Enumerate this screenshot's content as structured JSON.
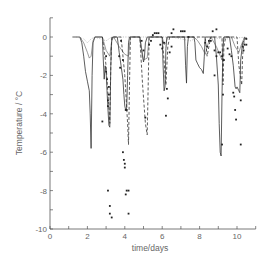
{
  "chart_data": {
    "type": "line",
    "title": "",
    "xlabel": "time/days",
    "ylabel": "Temperature / °C",
    "xlim": [
      0,
      11
    ],
    "ylim": [
      -10,
      1
    ],
    "xticks": [
      0,
      2,
      4,
      6,
      8,
      10
    ],
    "xminorticks": [
      1,
      3,
      5,
      7,
      9,
      11
    ],
    "yticks": [
      0,
      -2,
      -4,
      -6,
      -8,
      -10
    ],
    "yminorticks": [
      1,
      -1,
      -3,
      -5,
      -7,
      -9
    ],
    "grid": false,
    "legend": null,
    "series": [
      {
        "name": "solid line",
        "style": "solid",
        "points": [
          [
            1.2,
            0
          ],
          [
            1.6,
            0
          ],
          [
            1.7,
            -0.3
          ],
          [
            1.8,
            -1.0
          ],
          [
            1.9,
            -1.8
          ],
          [
            2.0,
            -2.3
          ],
          [
            2.1,
            -2.8
          ],
          [
            2.15,
            -4.0
          ],
          [
            2.2,
            -5.8
          ],
          [
            2.25,
            -2.0
          ],
          [
            2.3,
            -0.3
          ],
          [
            2.4,
            0
          ],
          [
            2.8,
            0
          ],
          [
            2.85,
            -1.2
          ],
          [
            2.9,
            -2.2
          ],
          [
            2.95,
            -1.5
          ],
          [
            3.0,
            -1.8
          ],
          [
            3.05,
            -2.8
          ],
          [
            3.1,
            -3.8
          ],
          [
            3.15,
            -4.6
          ],
          [
            3.2,
            -4.7
          ],
          [
            3.25,
            -1.5
          ],
          [
            3.3,
            -0.2
          ],
          [
            3.35,
            0
          ],
          [
            3.6,
            0
          ],
          [
            3.7,
            -0.8
          ],
          [
            3.8,
            -1.5
          ],
          [
            3.9,
            -2.2
          ],
          [
            3.95,
            -3.0
          ],
          [
            4.0,
            -3.6
          ],
          [
            4.05,
            -3.8
          ],
          [
            4.1,
            -3.7
          ],
          [
            4.15,
            -2.0
          ],
          [
            4.2,
            -0.3
          ],
          [
            4.25,
            0
          ],
          [
            4.8,
            0
          ],
          [
            4.9,
            -0.7
          ],
          [
            5.0,
            -1.3
          ],
          [
            5.05,
            -1.1
          ],
          [
            5.1,
            -0.3
          ],
          [
            5.2,
            0
          ],
          [
            6.0,
            0
          ],
          [
            6.05,
            -1.5
          ],
          [
            6.1,
            -2.8
          ],
          [
            6.15,
            -2.6
          ],
          [
            6.2,
            -0.6
          ],
          [
            6.25,
            0
          ],
          [
            7.2,
            0
          ],
          [
            7.25,
            -1.5
          ],
          [
            7.3,
            -2.4
          ],
          [
            7.35,
            -0.5
          ],
          [
            7.4,
            0
          ],
          [
            7.7,
            0
          ],
          [
            7.75,
            -0.3
          ],
          [
            7.8,
            -1.2
          ],
          [
            7.9,
            -1.4
          ],
          [
            8.0,
            -1.6
          ],
          [
            8.1,
            -1.7
          ],
          [
            8.2,
            -1.9
          ],
          [
            8.25,
            -1.0
          ],
          [
            8.3,
            0
          ],
          [
            8.8,
            0
          ],
          [
            8.9,
            -1.0
          ],
          [
            9.0,
            -2.5
          ],
          [
            9.05,
            -4.5
          ],
          [
            9.1,
            -6.0
          ],
          [
            9.15,
            -6.2
          ],
          [
            9.2,
            -3.0
          ],
          [
            9.25,
            -0.5
          ],
          [
            9.3,
            0
          ],
          [
            9.6,
            0
          ],
          [
            9.7,
            -0.7
          ],
          [
            9.8,
            -1.5
          ],
          [
            9.9,
            -2.6
          ],
          [
            9.95,
            -2.7
          ],
          [
            10.0,
            -2.6
          ],
          [
            10.1,
            -2.8
          ],
          [
            10.15,
            -2.9
          ],
          [
            10.2,
            -1.2
          ],
          [
            10.3,
            -0.3
          ],
          [
            10.5,
            0
          ]
        ]
      },
      {
        "name": "thin solid line",
        "style": "thin",
        "points": [
          [
            1.6,
            0
          ],
          [
            1.8,
            -0.3
          ],
          [
            2.0,
            -0.8
          ],
          [
            2.1,
            -1.1
          ],
          [
            2.2,
            -1.0
          ],
          [
            2.3,
            -0.2
          ],
          [
            2.4,
            0
          ],
          [
            2.8,
            0
          ],
          [
            3.0,
            -0.7
          ],
          [
            3.2,
            -1.0
          ],
          [
            3.3,
            -0.2
          ],
          [
            3.4,
            0
          ],
          [
            3.7,
            -0.5
          ],
          [
            4.0,
            -0.9
          ],
          [
            4.2,
            -1.0
          ],
          [
            4.3,
            0
          ],
          [
            4.8,
            0
          ],
          [
            5.0,
            -1.2
          ],
          [
            5.2,
            -1.1
          ],
          [
            5.3,
            0
          ],
          [
            6.0,
            0
          ],
          [
            6.1,
            -0.4
          ],
          [
            6.2,
            -0.3
          ],
          [
            6.3,
            0
          ],
          [
            7.7,
            0
          ],
          [
            7.9,
            -0.2
          ],
          [
            8.1,
            -0.5
          ],
          [
            8.3,
            -0.9
          ],
          [
            8.5,
            -0.2
          ],
          [
            8.6,
            0
          ],
          [
            8.9,
            -0.5
          ],
          [
            9.2,
            -1.2
          ],
          [
            9.3,
            0
          ],
          [
            9.7,
            0
          ],
          [
            9.9,
            -0.5
          ],
          [
            10.1,
            -0.8
          ],
          [
            10.2,
            -0.5
          ],
          [
            10.4,
            0
          ]
        ]
      },
      {
        "name": "dashed line",
        "style": "dashed",
        "points": [
          [
            2.8,
            0
          ],
          [
            3.0,
            -1.5
          ],
          [
            3.1,
            -3.0
          ],
          [
            3.2,
            -4.5
          ],
          [
            3.25,
            -1.5
          ],
          [
            3.3,
            0
          ],
          [
            3.8,
            0
          ],
          [
            4.0,
            -2.0
          ],
          [
            4.15,
            -4.5
          ],
          [
            4.2,
            -5.6
          ],
          [
            4.25,
            -2.5
          ],
          [
            4.3,
            0
          ],
          [
            4.8,
            0
          ],
          [
            4.95,
            -2.5
          ],
          [
            5.1,
            -4.5
          ],
          [
            5.2,
            -5.1
          ],
          [
            5.25,
            -2.5
          ],
          [
            5.3,
            0
          ],
          [
            6.0,
            0
          ],
          [
            6.2,
            -2.5
          ],
          [
            6.3,
            -0.5
          ],
          [
            6.4,
            0
          ],
          [
            8.3,
            0
          ],
          [
            8.4,
            -1.0
          ],
          [
            8.5,
            -0.5
          ],
          [
            8.6,
            0
          ],
          [
            9.2,
            0
          ],
          [
            9.25,
            -2.5
          ],
          [
            9.3,
            -0.5
          ],
          [
            9.4,
            0
          ],
          [
            10.0,
            0
          ],
          [
            10.1,
            -1.5
          ],
          [
            10.25,
            -2.5
          ],
          [
            10.3,
            -1.0
          ],
          [
            10.4,
            0
          ]
        ]
      },
      {
        "name": "dotted line",
        "style": "dotted",
        "points": [
          [
            1.4,
            0
          ],
          [
            1.8,
            -0.1
          ],
          [
            2.0,
            -0.3
          ],
          [
            2.2,
            -0.1
          ],
          [
            2.4,
            0
          ],
          [
            3.0,
            -0.2
          ],
          [
            3.3,
            0
          ],
          [
            6.5,
            0
          ],
          [
            7.0,
            -0.1
          ],
          [
            7.5,
            -0.2
          ],
          [
            8.0,
            0
          ],
          [
            9.5,
            -0.1
          ],
          [
            10.5,
            0
          ]
        ]
      },
      {
        "name": "observations",
        "style": "points",
        "points": [
          [
            2.8,
            -4.4
          ],
          [
            3.0,
            -1.0
          ],
          [
            3.0,
            -1.8
          ],
          [
            3.05,
            -2.2
          ],
          [
            3.1,
            -3.3
          ],
          [
            3.1,
            -3.6
          ],
          [
            3.15,
            -3.0
          ],
          [
            3.15,
            -2.6
          ],
          [
            3.1,
            -8.0
          ],
          [
            3.2,
            -8.8
          ],
          [
            3.2,
            -9.2
          ],
          [
            3.3,
            -9.4
          ],
          [
            3.7,
            -1.0
          ],
          [
            3.75,
            -1.6
          ],
          [
            3.8,
            -0.2
          ],
          [
            3.9,
            -1.2
          ],
          [
            3.9,
            -6.0
          ],
          [
            3.95,
            -6.4
          ],
          [
            4.0,
            -6.6
          ],
          [
            4.0,
            -6.8
          ],
          [
            4.05,
            -8.2
          ],
          [
            4.1,
            -8.0
          ],
          [
            4.2,
            -8.0
          ],
          [
            4.2,
            -9.2
          ],
          [
            4.05,
            -3.8
          ],
          [
            4.1,
            -3.8
          ],
          [
            4.9,
            -0.2
          ],
          [
            5.0,
            -0.7
          ],
          [
            5.1,
            -4.2
          ],
          [
            5.3,
            -0.4
          ],
          [
            5.4,
            -0.2
          ],
          [
            5.5,
            0.1
          ],
          [
            5.6,
            0.2
          ],
          [
            5.7,
            0.2
          ],
          [
            5.8,
            0.2
          ],
          [
            5.9,
            -0.4
          ],
          [
            6.0,
            -0.6
          ],
          [
            6.1,
            -0.3
          ],
          [
            6.2,
            -4.1
          ],
          [
            6.25,
            -2.7
          ],
          [
            6.3,
            -3.2
          ],
          [
            6.4,
            -0.8
          ],
          [
            6.5,
            -0.5
          ],
          [
            6.5,
            0.2
          ],
          [
            6.6,
            0.4
          ],
          [
            7.0,
            0.3
          ],
          [
            7.1,
            0.3
          ],
          [
            7.2,
            0.3
          ],
          [
            7.4,
            0
          ],
          [
            8.3,
            -0.3
          ],
          [
            8.4,
            -0.5
          ],
          [
            8.5,
            -0.2
          ],
          [
            8.6,
            -0.2
          ],
          [
            8.7,
            0.3
          ],
          [
            8.9,
            0.4
          ],
          [
            8.8,
            -0.7
          ],
          [
            8.9,
            -1.0
          ],
          [
            8.8,
            -2.0
          ],
          [
            9.0,
            -0.8
          ],
          [
            9.1,
            -0.8
          ],
          [
            9.2,
            -1.0
          ],
          [
            9.3,
            -1.2
          ],
          [
            9.25,
            -3.0
          ],
          [
            9.2,
            -5.6
          ],
          [
            9.5,
            -0.6
          ],
          [
            9.6,
            -0.9
          ],
          [
            9.7,
            -1.0
          ],
          [
            9.8,
            -2.9
          ],
          [
            9.85,
            -3.1
          ],
          [
            9.9,
            -3.8
          ],
          [
            9.95,
            -4.3
          ],
          [
            10.2,
            -3.3
          ],
          [
            10.2,
            -5.6
          ],
          [
            10.3,
            -0.5
          ],
          [
            10.35,
            -0.7
          ],
          [
            10.4,
            -0.4
          ],
          [
            10.5,
            -0.4
          ],
          [
            10.5,
            -0.1
          ]
        ]
      }
    ]
  }
}
